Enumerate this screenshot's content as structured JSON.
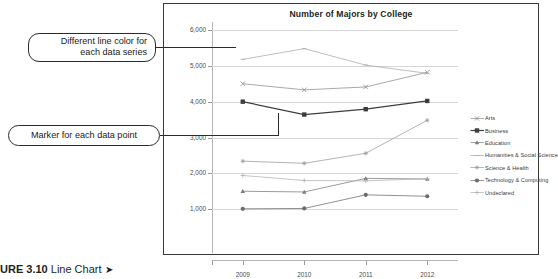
{
  "caption": {
    "figure_number": "URE 3.10",
    "label": "Line Chart",
    "arrow": "➤"
  },
  "callouts": [
    {
      "id": "line-color",
      "text": "Different line color for\neach data series"
    },
    {
      "id": "marker",
      "text": "Marker for each data point"
    }
  ],
  "legend": {
    "position": "right",
    "items": [
      {
        "label": "Arts",
        "marker": "x",
        "color": "#8c8c8c"
      },
      {
        "label": "Business",
        "marker": "square",
        "color": "#3d3d3d"
      },
      {
        "label": "Education",
        "marker": "triangle",
        "color": "#7a7a7a"
      },
      {
        "label": "Humanities & Social Science",
        "marker": "dash",
        "color": "#a8a8a8"
      },
      {
        "label": "Science & Health",
        "marker": "star",
        "color": "#9a9a9a"
      },
      {
        "label": "Technology & Computing",
        "marker": "circle",
        "color": "#6b6b6b"
      },
      {
        "label": "Undeclared",
        "marker": "plus",
        "color": "#b0b0b0"
      }
    ]
  },
  "chart_data": {
    "type": "line",
    "title": "Number of Majors by College",
    "xlabel": "",
    "ylabel": "",
    "categories": [
      "2009",
      "2010",
      "2011",
      "2012"
    ],
    "ylim": [
      0,
      6000
    ],
    "yticks": [
      "1,000",
      "2,000",
      "3,000",
      "4,000",
      "5,000",
      "6,000"
    ],
    "ytick_values": [
      1000,
      2000,
      3000,
      4000,
      5000,
      6000
    ],
    "grid": true,
    "series": [
      {
        "name": "Arts",
        "values": [
          4500,
          4330,
          4410,
          4820
        ],
        "color": "#8c8c8c",
        "marker": "x"
      },
      {
        "name": "Business",
        "values": [
          4000,
          3640,
          3790,
          4020
        ],
        "color": "#3d3d3d",
        "marker": "square"
      },
      {
        "name": "Education",
        "values": [
          1500,
          1480,
          1860,
          1840
        ],
        "color": "#7a7a7a",
        "marker": "triangle"
      },
      {
        "name": "Humanities & Social Science",
        "values": [
          5180,
          5480,
          5020,
          4790
        ],
        "color": "#a8a8a8",
        "marker": "dash"
      },
      {
        "name": "Science & Health",
        "values": [
          2340,
          2280,
          2560,
          3480
        ],
        "color": "#9a9a9a",
        "marker": "star"
      },
      {
        "name": "Technology & Computing",
        "values": [
          1010,
          1020,
          1400,
          1360
        ],
        "color": "#6b6b6b",
        "marker": "circle"
      },
      {
        "name": "Undeclared",
        "values": [
          1940,
          1800,
          1790,
          1850
        ],
        "color": "#b0b0b0",
        "marker": "plus"
      }
    ]
  }
}
